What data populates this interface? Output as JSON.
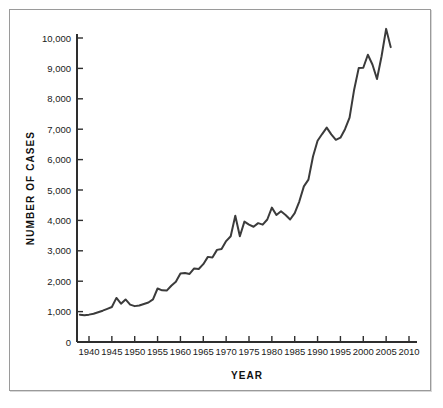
{
  "figure": {
    "border_color": "#9a9a9a",
    "background": "#ffffff"
  },
  "axes": {
    "y_title": "NUMBER OF CASES",
    "x_title": "YEAR",
    "y_ticks": [
      "0",
      "1,000",
      "2,000",
      "3,000",
      "4,000",
      "5,000",
      "6,000",
      "7,000",
      "8,000",
      "9,000",
      "10,000"
    ],
    "x_ticks": [
      "1940",
      "1945",
      "1950",
      "1955",
      "1960",
      "1965",
      "1970",
      "1975",
      "1980",
      "1985",
      "1990",
      "1995",
      "2000",
      "2005",
      "2010"
    ]
  },
  "chart_data": {
    "type": "line",
    "title": "",
    "subtitle": "",
    "xlabel": "YEAR",
    "ylabel": "NUMBER OF CASES",
    "xlim": [
      1937,
      2011
    ],
    "ylim": [
      0,
      10500
    ],
    "xtick_values": [
      1940,
      1945,
      1950,
      1955,
      1960,
      1965,
      1970,
      1975,
      1980,
      1985,
      1990,
      1995,
      2000,
      2005,
      2010
    ],
    "ytick_values": [
      0,
      1000,
      2000,
      3000,
      4000,
      5000,
      6000,
      7000,
      8000,
      9000,
      10000
    ],
    "grid": false,
    "legend": null,
    "line_color": "#3b3b3b",
    "line_width": 2,
    "series": [
      {
        "name": "Number of cases",
        "x": [
          1938,
          1939,
          1940,
          1941,
          1942,
          1943,
          1944,
          1945,
          1946,
          1947,
          1948,
          1949,
          1950,
          1951,
          1952,
          1953,
          1954,
          1955,
          1956,
          1957,
          1958,
          1959,
          1960,
          1961,
          1962,
          1963,
          1964,
          1965,
          1966,
          1967,
          1968,
          1969,
          1970,
          1971,
          1972,
          1973,
          1974,
          1975,
          1976,
          1977,
          1978,
          1979,
          1980,
          1981,
          1982,
          1983,
          1984,
          1985,
          1986,
          1987,
          1988,
          1989,
          1990,
          1991,
          1992,
          1993,
          1994,
          1995,
          1996,
          1997,
          1998,
          1999,
          2000,
          2001,
          2002,
          2003,
          2004,
          2005,
          2006
        ],
        "values": [
          900,
          880,
          900,
          930,
          980,
          1030,
          1090,
          1150,
          1450,
          1260,
          1400,
          1230,
          1180,
          1200,
          1250,
          1300,
          1400,
          1760,
          1700,
          1690,
          1850,
          1980,
          2250,
          2270,
          2240,
          2420,
          2400,
          2560,
          2800,
          2780,
          3030,
          3060,
          3320,
          3480,
          4150,
          3480,
          3960,
          3860,
          3790,
          3910,
          3860,
          4030,
          4420,
          4180,
          4300,
          4180,
          4030,
          4240,
          4620,
          5120,
          5340,
          6100,
          6620,
          6840,
          7050,
          6830,
          6650,
          6720,
          7000,
          7380,
          8300,
          9010,
          9020,
          9450,
          9130,
          8650,
          9400,
          10300,
          9700
        ]
      }
    ]
  }
}
